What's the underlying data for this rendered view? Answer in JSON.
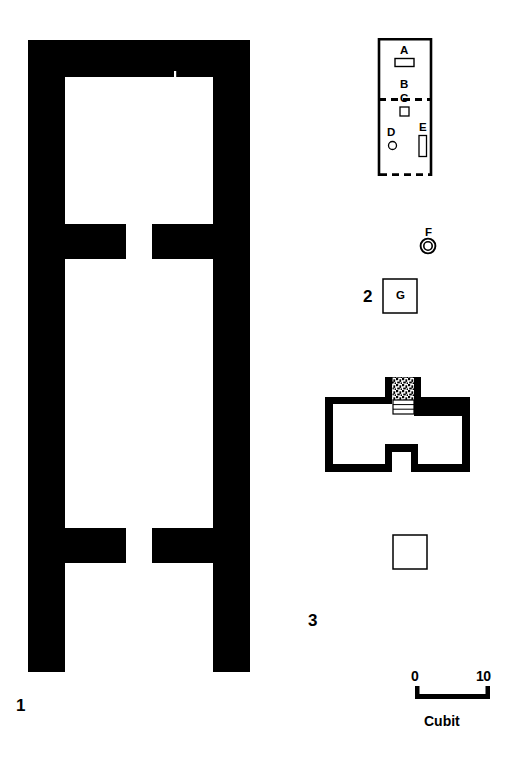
{
  "figure": {
    "type": "archaeological-plan-drawing",
    "ink_color": "#000000",
    "background_color": "#ffffff",
    "plans": [
      {
        "id": "plan-1",
        "number_label": "1",
        "description": "large rectangular building with thick solid black walls, pilaster stubs and open south end"
      },
      {
        "id": "plan-2",
        "number_label": "2",
        "description": "thin-outline rectangular building with dashed south wall and interior features A through E, plus detached features F and G"
      },
      {
        "id": "plan-3",
        "number_label": "3",
        "description": "cruciform building with thick solid black walls, stippled niche and stepped altar at north, with detached square feature"
      }
    ],
    "feature_labels": [
      {
        "key": "A",
        "text": "A",
        "plan": "plan-2"
      },
      {
        "key": "B",
        "text": "B",
        "plan": "plan-2"
      },
      {
        "key": "C",
        "text": "C",
        "plan": "plan-2"
      },
      {
        "key": "D",
        "text": "D",
        "plan": "plan-2"
      },
      {
        "key": "E",
        "text": "E",
        "plan": "plan-2"
      },
      {
        "key": "F",
        "text": "F",
        "plan": "plan-2"
      },
      {
        "key": "G",
        "text": "G",
        "plan": "plan-2"
      }
    ],
    "scale_bar": {
      "min_label": "0",
      "max_label": "10",
      "unit_label": "Cubit"
    }
  }
}
